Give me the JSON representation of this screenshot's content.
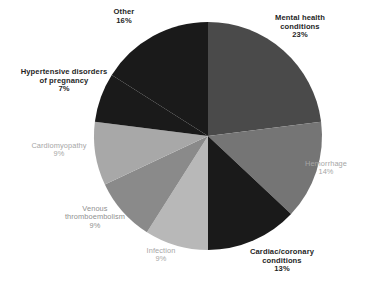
{
  "chart_data": {
    "type": "pie",
    "title": "",
    "subtitle": "",
    "xlabel": "",
    "ylabel": "",
    "legend_position": "none",
    "grid": false,
    "start_angle_deg": 0,
    "direction": "clockwise",
    "categories": [
      "Mental health conditions",
      "Hemorrhage",
      "Cardiac/coronary conditions",
      "Infection",
      "Venous thromboembolism",
      "Cardiomyopathy",
      "Hypertensive disorders of pregnancy",
      "Other"
    ],
    "values": [
      23,
      14,
      13,
      9,
      9,
      9,
      7,
      16
    ],
    "value_unit": "%",
    "colors": [
      "#4a4a4a",
      "#757575",
      "#1a1a1a",
      "#b8b8b8",
      "#8a8a8a",
      "#a8a8a8",
      "#1a1a1a",
      "#1a1a1a"
    ],
    "slices": [
      {
        "name": "Mental health conditions",
        "name_line1": "Mental health",
        "name_line2": "conditions",
        "value": 23,
        "pct_label": "23%",
        "color": "#4a4a4a",
        "label_style": "dark"
      },
      {
        "name": "Hemorrhage",
        "name_line1": "Hemorrhage",
        "name_line2": "",
        "value": 14,
        "pct_label": "14%",
        "color": "#757575",
        "label_style": "gray"
      },
      {
        "name": "Cardiac/coronary conditions",
        "name_line1": "Cardiac/coronary",
        "name_line2": "conditions",
        "value": 13,
        "pct_label": "13%",
        "color": "#1a1a1a",
        "label_style": "dark"
      },
      {
        "name": "Infection",
        "name_line1": "Infection",
        "name_line2": "",
        "value": 9,
        "pct_label": "9%",
        "color": "#b8b8b8",
        "label_style": "gray"
      },
      {
        "name": "Venous thromboembolism",
        "name_line1": "Venous",
        "name_line2": "thromboembolism",
        "value": 9,
        "pct_label": "9%",
        "color": "#8a8a8a",
        "label_style": "midgray"
      },
      {
        "name": "Cardiomyopathy",
        "name_line1": "Cardiomyopathy",
        "name_line2": "",
        "value": 9,
        "pct_label": "9%",
        "color": "#a8a8a8",
        "label_style": "gray"
      },
      {
        "name": "Hypertensive disorders of pregnancy",
        "name_line1": "Hypertensive disorders",
        "name_line2": "of pregnancy",
        "value": 7,
        "pct_label": "7%",
        "color": "#1a1a1a",
        "label_style": "dark"
      },
      {
        "name": "Other",
        "name_line1": "Other",
        "name_line2": "",
        "value": 16,
        "pct_label": "16%",
        "color": "#1a1a1a",
        "label_style": "dark"
      }
    ]
  },
  "geometry": {
    "center_x": 208,
    "center_y": 136,
    "radius": 114
  },
  "background_color": "#ffffff"
}
